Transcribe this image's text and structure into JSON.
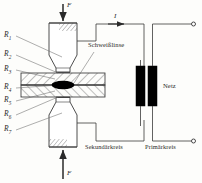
{
  "figure": {
    "colors": {
      "line": "#3a3a3a",
      "hatch": "#4a4a4a",
      "nugget": "#000000",
      "text": "#2a2a2a",
      "background": "#fdfdfb"
    }
  },
  "resistances": [
    {
      "id": "R1",
      "label": "R",
      "sub": "1"
    },
    {
      "id": "R2",
      "label": "R",
      "sub": "2"
    },
    {
      "id": "R3",
      "label": "R",
      "sub": "3"
    },
    {
      "id": "R4",
      "label": "R",
      "sub": "4"
    },
    {
      "id": "R5",
      "label": "R",
      "sub": "5"
    },
    {
      "id": "R6",
      "label": "R",
      "sub": "6"
    },
    {
      "id": "R7",
      "label": "R",
      "sub": "7"
    }
  ],
  "annotations": {
    "force_top": "F",
    "force_bottom": "F",
    "current": "I",
    "weld_nugget": "Schweißlinse",
    "mains": "Netz",
    "secondary_circuit": "Sekundärkreis",
    "primary_circuit": "Primärkreis"
  }
}
